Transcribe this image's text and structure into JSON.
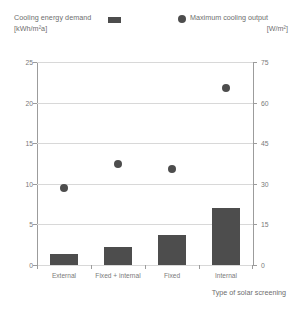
{
  "legend": {
    "bar_series_label": "Cooling energy demand",
    "bar_series_unit": "[kWh/m²a]",
    "dot_series_label": "Maximum cooling output",
    "dot_series_unit": "[W/m²]",
    "bar_swatch_icon": "filled-rectangle-swatch",
    "dot_swatch_icon": "filled-circle-swatch",
    "bar_color": "#4d4d4d",
    "dot_color": "#4d4d4d"
  },
  "axes": {
    "left_ticks": [
      "0",
      "5",
      "10",
      "15",
      "20",
      "25"
    ],
    "right_ticks": [
      "0",
      "15",
      "30",
      "45",
      "60",
      "75"
    ],
    "x_title": "Type of solar screening"
  },
  "chart_data": {
    "type": "bar",
    "title": "",
    "subtitle": "",
    "categories": [
      "External",
      "Fixed + internal",
      "Fixed",
      "Internal"
    ],
    "xlabel": "Type of solar screening",
    "ylabel": "Cooling energy demand [kWh/m²a]",
    "ylabel_right": "Maximum cooling output [W/m²]",
    "ylim": [
      0,
      25
    ],
    "ylim_right": [
      0,
      75
    ],
    "yticks": [
      0,
      5,
      10,
      15,
      20,
      25
    ],
    "yticks_right": [
      0,
      15,
      30,
      45,
      60,
      75
    ],
    "grid": true,
    "legend_position": "top",
    "series": [
      {
        "name": "Cooling energy demand",
        "unit": "kWh/m²a",
        "kind": "bar",
        "axis": "left",
        "values": [
          1.4,
          2.2,
          3.7,
          7.0
        ]
      },
      {
        "name": "Maximum cooling output",
        "unit": "W/m²",
        "kind": "scatter",
        "axis": "right",
        "values": [
          28.5,
          37.5,
          35.5,
          65.5
        ]
      }
    ]
  }
}
